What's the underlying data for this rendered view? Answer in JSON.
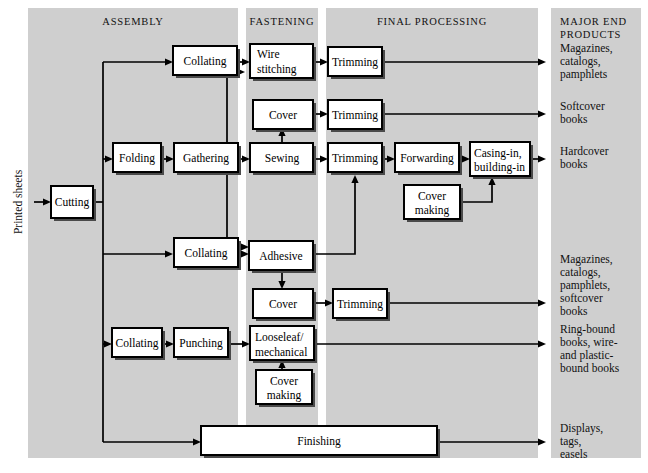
{
  "figure": {
    "background": "#ffffff",
    "band_color": "#cfcfcf",
    "line_color": "#000000",
    "box_fill": "#ffffff"
  },
  "column_headers": [
    {
      "id": "assembly",
      "label": "ASSEMBLY"
    },
    {
      "id": "fastening",
      "label": "FASTENING"
    },
    {
      "id": "final-processing",
      "label": "FINAL PROCESSING"
    },
    {
      "id": "major-end-products",
      "label_line1": "MAJOR END",
      "label_line2": "PRODUCTS"
    }
  ],
  "input_label": "Printed sheets",
  "nodes": [
    {
      "id": "cutting",
      "line1": "Cutting",
      "line2": ""
    },
    {
      "id": "collating-1",
      "line1": "Collating",
      "line2": ""
    },
    {
      "id": "folding",
      "line1": "Folding",
      "line2": ""
    },
    {
      "id": "gathering",
      "line1": "Gathering",
      "line2": ""
    },
    {
      "id": "collating-2",
      "line1": "Collating",
      "line2": ""
    },
    {
      "id": "collating-3",
      "line1": "Collating",
      "line2": ""
    },
    {
      "id": "punching",
      "line1": "Punching",
      "line2": ""
    },
    {
      "id": "wire-stitching",
      "line1": "Wire",
      "line2": "stitching"
    },
    {
      "id": "cover-1",
      "line1": "Cover",
      "line2": ""
    },
    {
      "id": "sewing",
      "line1": "Sewing",
      "line2": ""
    },
    {
      "id": "adhesive",
      "line1": "Adhesive",
      "line2": ""
    },
    {
      "id": "cover-2",
      "line1": "Cover",
      "line2": ""
    },
    {
      "id": "looseleaf",
      "line1": "Looseleaf/",
      "line2": "mechanical"
    },
    {
      "id": "cover-making-2",
      "line1": "Cover",
      "line2": "making"
    },
    {
      "id": "trimming-1",
      "line1": "Trimming",
      "line2": ""
    },
    {
      "id": "trimming-2",
      "line1": "Trimming",
      "line2": ""
    },
    {
      "id": "trimming-3",
      "line1": "Trimming",
      "line2": ""
    },
    {
      "id": "trimming-4",
      "line1": "Trimming",
      "line2": ""
    },
    {
      "id": "forwarding",
      "line1": "Forwarding",
      "line2": ""
    },
    {
      "id": "casing-in",
      "line1": "Casing-in,",
      "line2": "building-in"
    },
    {
      "id": "cover-making-1",
      "line1": "Cover",
      "line2": "making"
    },
    {
      "id": "finishing",
      "line1": "Finishing",
      "line2": ""
    }
  ],
  "end_products": [
    {
      "id": "ep-1",
      "lines": [
        "Magazines,",
        "catalogs,",
        "pamphlets"
      ]
    },
    {
      "id": "ep-2",
      "lines": [
        "Softcover",
        "books"
      ]
    },
    {
      "id": "ep-3",
      "lines": [
        "Hardcover",
        "books"
      ]
    },
    {
      "id": "ep-4",
      "lines": [
        "Magazines,",
        "catalogs,",
        "pamphlets,",
        "softcover",
        "books"
      ]
    },
    {
      "id": "ep-5",
      "lines": [
        "Ring-bound",
        "books, wire-",
        "and plastic-",
        "bound books"
      ]
    },
    {
      "id": "ep-6",
      "lines": [
        "Displays,",
        "tags,",
        "easels"
      ]
    }
  ]
}
